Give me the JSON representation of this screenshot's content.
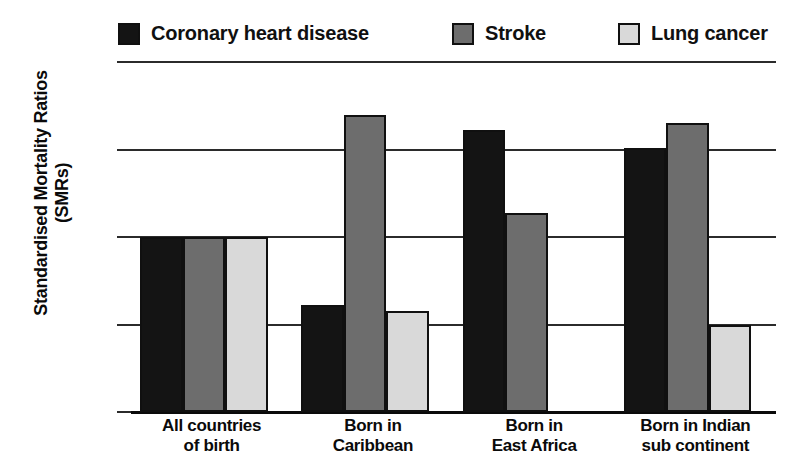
{
  "chart_data": {
    "type": "bar",
    "title": "",
    "subtitle": "",
    "xlabel": "",
    "ylabel": "Standardised Mortality Ratios (SMRs)",
    "ylabel_line1": "Standardised Mortality Ratios",
    "ylabel_line2": "(SMRs)",
    "categories": [
      "All countries of birth",
      "Born in Caribbean",
      "Born in East Africa",
      "Born in Indian sub continent"
    ],
    "category_lines": [
      [
        "All countries",
        "of birth"
      ],
      [
        "Born in",
        "Caribbean"
      ],
      [
        "Born in",
        "East Africa"
      ],
      [
        "Born in Indian",
        "sub continent"
      ]
    ],
    "series": [
      {
        "name": "Coronary heart disease",
        "color": "#141414",
        "values": [
          100,
          61,
          161,
          151
        ]
      },
      {
        "name": "Stroke",
        "color": "#6d6d6d",
        "values": [
          100,
          170,
          114,
          165
        ]
      },
      {
        "name": "Lung cancer",
        "color": "#d9d9d9",
        "values": [
          100,
          58,
          0,
          50
        ]
      }
    ],
    "ylim": [
      0,
      200
    ],
    "yticks": [
      0,
      50,
      100,
      150,
      200
    ],
    "ytick_labels": [
      "0",
      "50",
      "100",
      "150",
      "200"
    ],
    "grid": true,
    "grid_axis": "y",
    "legend_position": "top"
  },
  "legend": {
    "items": [
      {
        "label": "Coronary heart disease",
        "color": "#141414"
      },
      {
        "label": "Stroke",
        "color": "#6d6d6d"
      },
      {
        "label": "Lung cancer",
        "color": "#d9d9d9"
      }
    ]
  }
}
